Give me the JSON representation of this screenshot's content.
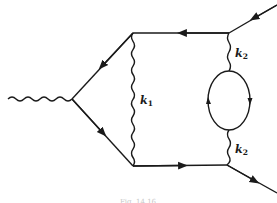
{
  "diagram": {
    "type": "feynman-diagram",
    "colors": {
      "line": "#1a1a1a",
      "background": "#ffffff",
      "caption": "#c8c8c8"
    },
    "labels": {
      "k1": {
        "base": "k",
        "sub": "1"
      },
      "k2_top": {
        "base": "k",
        "sub": "2"
      },
      "k2_bottom": {
        "base": "k",
        "sub": "2"
      }
    },
    "caption": "Fig. 14.16"
  }
}
